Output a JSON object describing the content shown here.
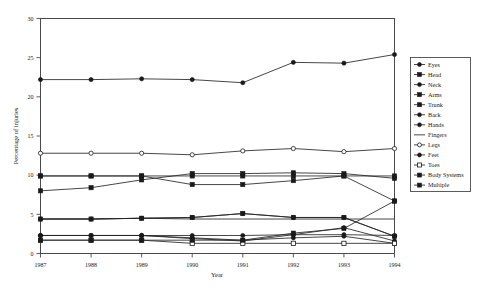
{
  "chart_data": {
    "type": "line",
    "title": "",
    "xlabel": "Year",
    "ylabel": "Percentage of injuries",
    "categories": [
      "1987",
      "1988",
      "1989",
      "1990",
      "1991",
      "1992",
      "1993",
      "1994"
    ],
    "x": [
      1987,
      1988,
      1989,
      1990,
      1991,
      1992,
      1993,
      1994
    ],
    "xlim": [
      1987,
      1994
    ],
    "ylim": [
      0,
      30
    ],
    "yticks": [
      0,
      5,
      10,
      15,
      20,
      25,
      30
    ],
    "ytick_labels": [
      "0",
      "5",
      "10",
      "15",
      "20",
      "25",
      "30"
    ],
    "xtick_labels": [
      "1987",
      "1988",
      "1989",
      "1990",
      "1991",
      "1992",
      "1993",
      "1994"
    ],
    "grid": false,
    "legend_position": "right",
    "series": [
      {
        "name": "Eyes",
        "marker": "filled-circle",
        "values": [
          4.4,
          4.4,
          4.5,
          4.6,
          5.1,
          4.6,
          4.6,
          2.2
        ]
      },
      {
        "name": "Head",
        "marker": "filled-square",
        "values": [
          9.9,
          9.9,
          9.9,
          9.9,
          9.9,
          9.9,
          9.9,
          9.9
        ]
      },
      {
        "name": "Neck",
        "marker": "filled-circle",
        "values": [
          2.3,
          2.3,
          2.3,
          1.9,
          1.6,
          2.4,
          3.3,
          1.6
        ]
      },
      {
        "name": "Arms",
        "marker": "filled-square",
        "values": [
          8.0,
          8.4,
          9.4,
          10.2,
          10.2,
          10.3,
          10.2,
          9.6
        ]
      },
      {
        "name": "Trunk",
        "marker": "filled-square",
        "values": [
          9.9,
          9.9,
          9.9,
          8.8,
          8.8,
          9.3,
          9.9,
          6.7
        ]
      },
      {
        "name": "Back",
        "marker": "filled-circle",
        "values": [
          22.2,
          22.2,
          22.3,
          22.2,
          21.8,
          24.4,
          24.3,
          25.4
        ]
      },
      {
        "name": "Hands",
        "marker": "filled-circle",
        "values": [
          2.3,
          2.3,
          2.3,
          2.0,
          1.7,
          2.0,
          2.2,
          1.3
        ]
      },
      {
        "name": "Fingers",
        "marker": "none",
        "values": [
          4.4,
          4.4,
          4.5,
          4.4,
          4.4,
          4.4,
          4.4,
          4.4
        ]
      },
      {
        "name": "Legs",
        "marker": "open-circle",
        "values": [
          12.8,
          12.8,
          12.8,
          12.6,
          13.1,
          13.4,
          13.0,
          13.4
        ]
      },
      {
        "name": "Feet",
        "marker": "filled-circle",
        "values": [
          2.3,
          2.3,
          2.3,
          2.3,
          2.3,
          2.4,
          2.4,
          2.3
        ]
      },
      {
        "name": "Toes",
        "marker": "open-square",
        "values": [
          1.7,
          1.7,
          1.7,
          1.3,
          1.3,
          1.3,
          1.3,
          1.3
        ]
      },
      {
        "name": "Body Systems",
        "marker": "filled-square",
        "values": [
          1.7,
          1.7,
          1.7,
          1.7,
          1.7,
          2.6,
          3.2,
          6.7
        ]
      },
      {
        "name": "Multiple",
        "marker": "filled-square",
        "values": [
          4.4,
          4.4,
          4.5,
          4.6,
          5.1,
          4.6,
          4.6,
          2.2
        ]
      }
    ]
  },
  "legend": {
    "entries": [
      {
        "label": "Eyes"
      },
      {
        "label": "Head"
      },
      {
        "label": "Neck"
      },
      {
        "label": "Arms"
      },
      {
        "label": "Trunk"
      },
      {
        "label": "Back"
      },
      {
        "label": "Hands"
      },
      {
        "label": "Fingers"
      },
      {
        "label": "Legs"
      },
      {
        "label": "Feet"
      },
      {
        "label": "Toes"
      },
      {
        "label": "Body Systems"
      },
      {
        "label": "Multiple"
      }
    ]
  },
  "colors": {
    "line": "#262626",
    "axis": "#4a4a4a",
    "background": "#ffffff",
    "text": "#1a1a1a"
  }
}
